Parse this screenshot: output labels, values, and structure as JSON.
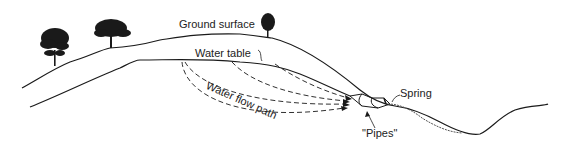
{
  "diagram": {
    "type": "cross-section",
    "labels": {
      "ground_surface": "Ground surface",
      "water_table": "Water table",
      "water_flow_path": "Water flow path",
      "spring": "Spring",
      "pipes": "\"Pipes\""
    },
    "elements": {
      "trees": 3,
      "flow_paths": 4
    },
    "colors": {
      "line": "#1a1a1a",
      "background": "#ffffff"
    }
  }
}
